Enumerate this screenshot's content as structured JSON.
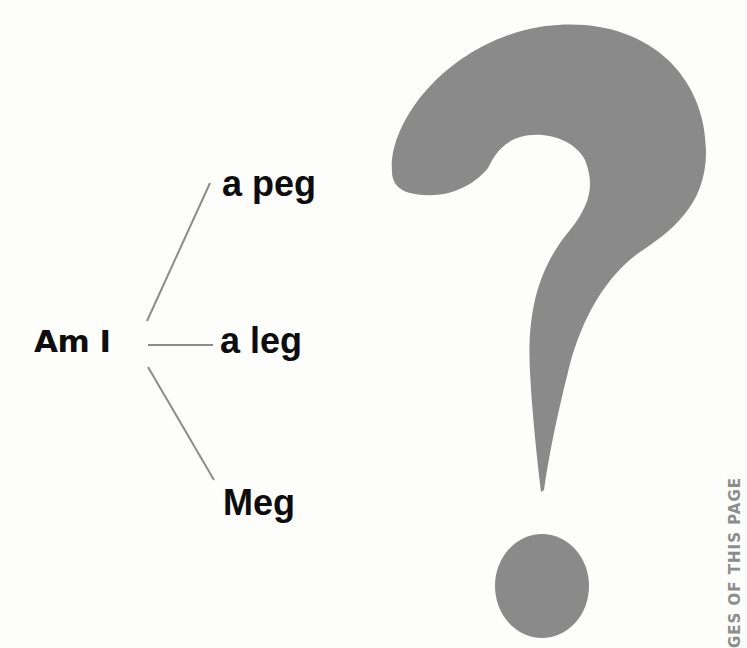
{
  "diagram": {
    "root": {
      "label": "Am I"
    },
    "branches": [
      {
        "label": "a peg"
      },
      {
        "label": "a leg"
      },
      {
        "label": "Meg"
      }
    ],
    "line_color": "#8c8c8c",
    "text_color": "#0d0d0d"
  },
  "graphic": {
    "icon": "question-mark-icon",
    "color": "#8a8a8a"
  },
  "margin_text": "GES OF THIS PAGE"
}
